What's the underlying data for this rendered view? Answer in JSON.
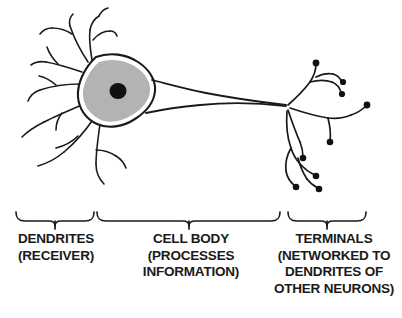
{
  "figure": {
    "background_color": "#ffffff",
    "stroke_color": "#1a1a1a",
    "soma_fill_color": "#b3b3b3",
    "nucleus_color": "#111111",
    "membrane_highlight_color": "#ffffff"
  },
  "parts": {
    "dendrites_name": "dendrites",
    "soma_name": "cell-body",
    "nucleus_name": "nucleus",
    "axon_name": "axon",
    "terminals_name": "axon-terminals"
  },
  "labels": [
    {
      "id": "dendrites",
      "lines": [
        "DENDRITES",
        "(RECEIVER)"
      ],
      "line1": "DENDRITES",
      "line2": "(RECEIVER)",
      "line3": "",
      "line4": ""
    },
    {
      "id": "cell-body",
      "lines": [
        "CELL BODY",
        "(PROCESSES",
        "INFORMATION)"
      ],
      "line1": "CELL BODY",
      "line2": "(PROCESSES",
      "line3": "INFORMATION)",
      "line4": ""
    },
    {
      "id": "terminals",
      "lines": [
        "TERMINALS",
        "(NETWORKED TO",
        "DENDRITES OF",
        "OTHER NEURONS)"
      ],
      "line1": "TERMINALS",
      "line2": "(NETWORKED TO",
      "line3": "DENDRITES OF",
      "line4": "OTHER NEURONS)"
    }
  ],
  "brackets": [
    {
      "id": "dendrites-bracket",
      "left": 16,
      "right": 94,
      "tick_x": 55
    },
    {
      "id": "cell-body-bracket",
      "left": 97,
      "right": 280,
      "tick_x": 189
    },
    {
      "id": "terminals-bracket",
      "left": 288,
      "right": 366,
      "tick_x": 327
    }
  ]
}
